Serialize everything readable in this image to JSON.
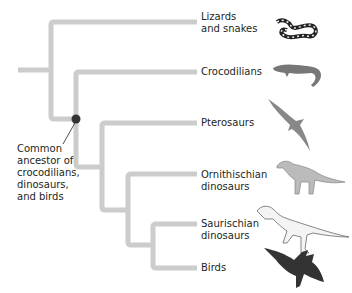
{
  "diagram": {
    "type": "cladogram",
    "line_color": "#cccccc",
    "node_color": "#333333",
    "taxa": [
      {
        "id": "lizards",
        "label": "Lizards\nand snakes",
        "icon": "snake-icon"
      },
      {
        "id": "crocs",
        "label": "Crocodilians",
        "icon": "crocodile-icon"
      },
      {
        "id": "pterosaurs",
        "label": "Pterosaurs",
        "icon": "pterosaur-icon"
      },
      {
        "id": "ornithischian",
        "label": "Ornithischian\ndinosaurs",
        "icon": "hadrosaur-icon"
      },
      {
        "id": "saurischian",
        "label": "Saurischian\ndinosaurs",
        "icon": "theropod-icon"
      },
      {
        "id": "birds",
        "label": "Birds",
        "icon": "bird-icon"
      }
    ],
    "annotation": {
      "label": "Common\nancestor of\ncrocodilians,\ndinosaurs,\nand birds",
      "points_to": "node-archosaur"
    }
  }
}
